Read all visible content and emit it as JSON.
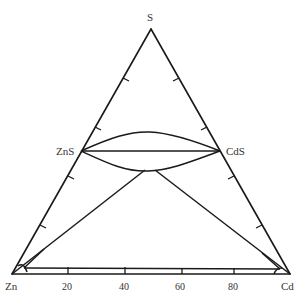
{
  "diagram": {
    "type": "ternary-phase-diagram",
    "vertices": {
      "top": "S",
      "bottom_left": "Zn",
      "bottom_right": "Cd"
    },
    "compounds": {
      "left": "ZnS",
      "right": "CdS"
    },
    "base_axis": {
      "tick_labels": [
        "20",
        "40",
        "60",
        "80"
      ]
    },
    "colors": {
      "line": "#1a1a1a",
      "text": "#333333",
      "background": "#ffffff"
    }
  }
}
